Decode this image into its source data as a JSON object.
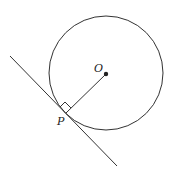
{
  "diagram": {
    "title": "",
    "labels": {
      "center": "O",
      "tangent_point": "P"
    },
    "colors": {
      "stroke": "#333333",
      "background": "#ffffff"
    },
    "circle": {
      "cx": 106,
      "cy": 73,
      "r": 57
    },
    "center_point": {
      "x": 106,
      "y": 74
    },
    "tangent_point": {
      "x": 66,
      "y": 113
    },
    "tangent_line": {
      "x1": 10,
      "y1": 56,
      "x2": 117,
      "y2": 166
    },
    "right_angle_marker": true
  }
}
